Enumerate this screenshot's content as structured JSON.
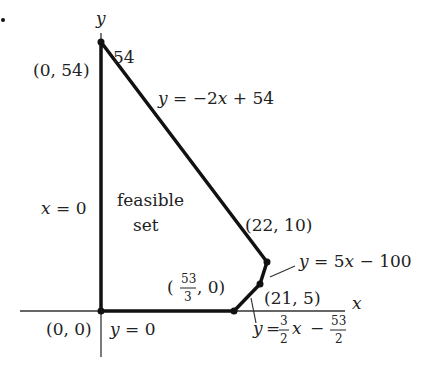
{
  "figure": {
    "type": "linear-programming-feasible-region",
    "bullet": ".",
    "axes": {
      "x_label": "x",
      "y_label": "y"
    },
    "region_label": [
      "feasible",
      "set"
    ],
    "y_tick_label": "54",
    "vertices": [
      {
        "label": "(0, 54)",
        "x": 0,
        "y": 54
      },
      {
        "label": "(22, 10)",
        "x": 22,
        "y": 10
      },
      {
        "label": "(21, 5)",
        "x": 21,
        "y": 5
      },
      {
        "label_parts": {
          "open": "(",
          "num": "53",
          "den": "3",
          "rest": ", 0)"
        },
        "x": 17.667,
        "y": 0
      },
      {
        "label": "(0, 0)",
        "x": 0,
        "y": 0
      }
    ],
    "constraints": {
      "left": "x = 0",
      "bottom": "y = 0",
      "top": "y = −2x + 54",
      "right_upper": "y = 5x − 100",
      "right_lower": {
        "prefix": "y = ",
        "coef_num": "3",
        "coef_den": "2",
        "var": "x",
        "op": "−",
        "const_num": "53",
        "const_den": "2"
      }
    }
  }
}
